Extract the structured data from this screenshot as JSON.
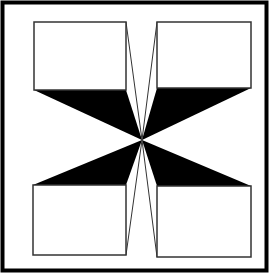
{
  "figure": {
    "title": "",
    "colors": {
      "background": "#ffffff",
      "ink": "#000000",
      "line": "#333333"
    },
    "frame": {
      "x": 2,
      "y": 2,
      "w": 264,
      "h": 268
    },
    "center": {
      "x": 142,
      "y": 140
    },
    "boxes": [
      {
        "name": "top-left",
        "x1": 34,
        "y1": 22,
        "x2": 126,
        "y2": 90
      },
      {
        "name": "top-right",
        "x1": 157,
        "y1": 22,
        "x2": 251,
        "y2": 88
      },
      {
        "name": "bottom-left",
        "x1": 33,
        "y1": 185,
        "x2": 126,
        "y2": 255
      },
      {
        "name": "bottom-right",
        "x1": 157,
        "y1": 186,
        "x2": 251,
        "y2": 257
      }
    ]
  }
}
